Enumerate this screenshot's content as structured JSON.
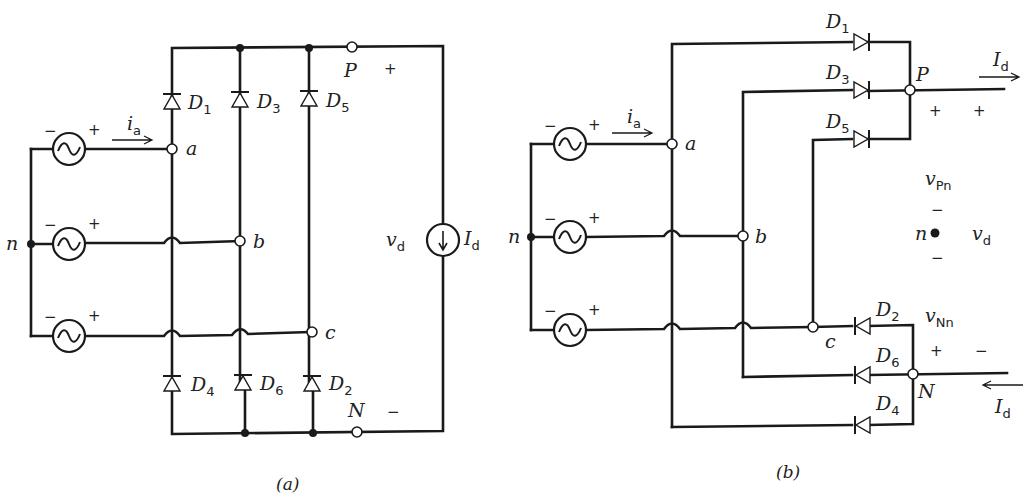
{
  "figure": {
    "panels": [
      {
        "id": "a",
        "caption": "(a)",
        "title": "Three-phase full-bridge diode rectifier",
        "sources": [
          {
            "phase": "a",
            "minus": "−",
            "plus": "+"
          },
          {
            "phase": "b",
            "minus": "−",
            "plus": "+"
          },
          {
            "phase": "c",
            "minus": "−",
            "plus": "+"
          }
        ],
        "neutral_label": "n",
        "current_label": {
          "main": "i",
          "sub": "a"
        },
        "nodes": {
          "a": "a",
          "b": "b",
          "c": "c",
          "P": "P",
          "N": "N"
        },
        "diodes": {
          "top": [
            {
              "main": "D",
              "sub": "1"
            },
            {
              "main": "D",
              "sub": "3"
            },
            {
              "main": "D",
              "sub": "5"
            }
          ],
          "bottom": [
            {
              "main": "D",
              "sub": "4"
            },
            {
              "main": "D",
              "sub": "6"
            },
            {
              "main": "D",
              "sub": "2"
            }
          ]
        },
        "output_voltage": {
          "main": "v",
          "sub": "d",
          "plus": "+",
          "minus": "−"
        },
        "load_current": {
          "main": "I",
          "sub": "d"
        }
      },
      {
        "id": "b",
        "caption": "(b)",
        "title": "Redrawn as two groups (common-cathode and common-anode)",
        "sources": [
          {
            "phase": "a",
            "minus": "−",
            "plus": "+"
          },
          {
            "phase": "b",
            "minus": "−",
            "plus": "+"
          },
          {
            "phase": "c",
            "minus": "−",
            "plus": "+"
          }
        ],
        "neutral_label": "n",
        "current_label": {
          "main": "i",
          "sub": "a"
        },
        "nodes": {
          "a": "a",
          "b": "b",
          "c": "c",
          "P": "P",
          "N": "N"
        },
        "diodes": {
          "upper_group": [
            {
              "main": "D",
              "sub": "1"
            },
            {
              "main": "D",
              "sub": "3"
            },
            {
              "main": "D",
              "sub": "5"
            }
          ],
          "lower_group": [
            {
              "main": "D",
              "sub": "2"
            },
            {
              "main": "D",
              "sub": "6"
            },
            {
              "main": "D",
              "sub": "4"
            }
          ]
        },
        "voltages": {
          "vPn": {
            "main": "v",
            "sub": "Pn",
            "plus": "+",
            "minus": "−"
          },
          "vNn": {
            "main": "v",
            "sub": "Nn",
            "plus": "+",
            "minus": "−"
          },
          "vd": {
            "main": "v",
            "sub": "d",
            "plus": "+",
            "minus": "−"
          }
        },
        "center_node": "n",
        "load_current_out": {
          "main": "I",
          "sub": "d"
        },
        "load_current_in": {
          "main": "I",
          "sub": "d"
        }
      }
    ]
  }
}
